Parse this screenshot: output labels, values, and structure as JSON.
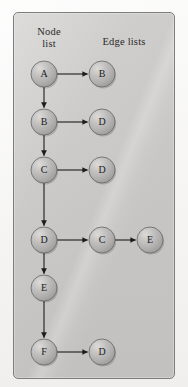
{
  "figure": {
    "headings": {
      "node_list": "Node\nlist",
      "edge_lists": "Edge lists"
    },
    "colors": {
      "page_background": "#f2f1ef",
      "panel_background": "#c9c8c6",
      "panel_border": "#7d7d7d",
      "node_fill": "#b6b5b3",
      "node_stroke": "#6f6f6f",
      "node_highlight": "#d9d8d6",
      "arrow": "#1c1c1c",
      "label_text": "#2a2a2a"
    },
    "geometry": {
      "panel": {
        "x": 13,
        "y": 12,
        "width": 162,
        "height": 367,
        "radius": 5
      },
      "node_radius": 13,
      "column_x": [
        44,
        102,
        150
      ],
      "row_y": [
        74,
        122,
        170,
        240,
        288,
        352
      ]
    },
    "nodes": [
      {
        "id": "n0",
        "label": "A",
        "cx": 44,
        "cy": 74,
        "column": 0,
        "row": 0
      },
      {
        "id": "n1",
        "label": "B",
        "cx": 102,
        "cy": 74,
        "column": 1,
        "row": 0
      },
      {
        "id": "n2",
        "label": "B",
        "cx": 44,
        "cy": 122,
        "column": 0,
        "row": 1
      },
      {
        "id": "n3",
        "label": "D",
        "cx": 102,
        "cy": 122,
        "column": 1,
        "row": 1
      },
      {
        "id": "n4",
        "label": "C",
        "cx": 44,
        "cy": 170,
        "column": 0,
        "row": 2
      },
      {
        "id": "n5",
        "label": "D",
        "cx": 102,
        "cy": 170,
        "column": 1,
        "row": 2
      },
      {
        "id": "n6",
        "label": "D",
        "cx": 44,
        "cy": 240,
        "column": 0,
        "row": 3
      },
      {
        "id": "n7",
        "label": "C",
        "cx": 102,
        "cy": 240,
        "column": 1,
        "row": 3
      },
      {
        "id": "n8",
        "label": "E",
        "cx": 150,
        "cy": 240,
        "column": 2,
        "row": 3
      },
      {
        "id": "n9",
        "label": "E",
        "cx": 44,
        "cy": 288,
        "column": 0,
        "row": 4
      },
      {
        "id": "n10",
        "label": "F",
        "cx": 44,
        "cy": 352,
        "column": 0,
        "row": 5
      },
      {
        "id": "n11",
        "label": "D",
        "cx": 102,
        "cy": 352,
        "column": 1,
        "row": 5
      }
    ],
    "edges": [
      {
        "from": "n0",
        "to": "n1",
        "direction": "horizontal"
      },
      {
        "from": "n0",
        "to": "n2",
        "direction": "vertical"
      },
      {
        "from": "n2",
        "to": "n3",
        "direction": "horizontal"
      },
      {
        "from": "n2",
        "to": "n4",
        "direction": "vertical"
      },
      {
        "from": "n4",
        "to": "n5",
        "direction": "horizontal"
      },
      {
        "from": "n4",
        "to": "n6",
        "direction": "vertical"
      },
      {
        "from": "n6",
        "to": "n7",
        "direction": "horizontal"
      },
      {
        "from": "n7",
        "to": "n8",
        "direction": "horizontal"
      },
      {
        "from": "n6",
        "to": "n9",
        "direction": "vertical"
      },
      {
        "from": "n9",
        "to": "n10",
        "direction": "vertical"
      },
      {
        "from": "n10",
        "to": "n11",
        "direction": "horizontal"
      }
    ]
  }
}
